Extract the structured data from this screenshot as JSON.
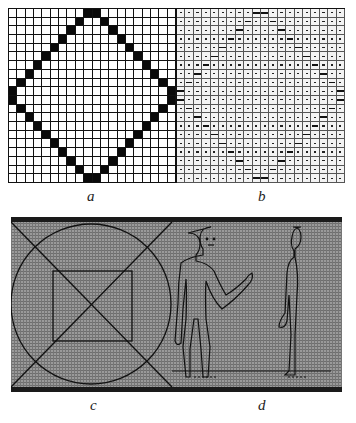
{
  "figure": {
    "panels": [
      {
        "id": "a",
        "label": "a",
        "description": "binary pixel grid with diamond outline"
      },
      {
        "id": "b",
        "label": "b",
        "description": "character-printed grid with diamond outline"
      },
      {
        "id": "c",
        "label": "c",
        "description": "circle, inscribed square and diagonals on grey raster"
      },
      {
        "id": "d",
        "label": "d",
        "description": "front and side human figures on grey raster"
      }
    ],
    "grid": {
      "columns": 20,
      "rows": 20
    },
    "diamond_rows": [
      [
        9,
        10
      ],
      [
        8,
        11
      ],
      [
        7,
        12
      ],
      [
        6,
        13
      ],
      [
        5,
        14
      ],
      [
        4,
        15
      ],
      [
        3,
        16
      ],
      [
        2,
        17
      ],
      [
        1,
        18
      ],
      [
        0,
        19
      ],
      [
        0,
        19
      ],
      [
        1,
        18
      ],
      [
        2,
        17
      ],
      [
        3,
        16
      ],
      [
        4,
        15
      ],
      [
        5,
        14
      ],
      [
        6,
        13
      ],
      [
        7,
        12
      ],
      [
        8,
        11
      ],
      [
        9,
        10
      ]
    ],
    "colors": {
      "ink": "#0a0a0a",
      "raster_grey": "#8a8a8a",
      "paper": "#ffffff"
    }
  }
}
